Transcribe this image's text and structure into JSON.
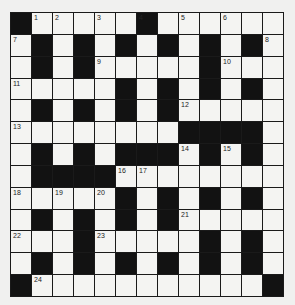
{
  "puzzle": {
    "rows": 13,
    "cols": 13,
    "colors": {
      "background": "#f0f0ef",
      "white_cell": "#f4f4f2",
      "black_cell": "#121212",
      "grid_line": "#1a1a1a"
    },
    "layout": [
      "#.....#......",
      ".#.#.#.#.#.#.",
      ".#.#.....#...",
      ".....#.#.#.#.",
      ".#.#.#.#.....",
      "........####.",
      ".#.#.###.#.#.",
      ".####........",
      ".....#.#.#.#.",
      ".#.#.#.#.....",
      "...#.....#.#.",
      ".#.#.#.#.#.#.",
      "#...........#"
    ],
    "numbers": [
      {
        "row": 0,
        "col": 1,
        "n": "1"
      },
      {
        "row": 0,
        "col": 2,
        "n": "2"
      },
      {
        "row": 0,
        "col": 4,
        "n": "3"
      },
      {
        "row": 0,
        "col": 6,
        "n": "4"
      },
      {
        "row": 0,
        "col": 8,
        "n": "5"
      },
      {
        "row": 0,
        "col": 10,
        "n": "6"
      },
      {
        "row": 1,
        "col": 0,
        "n": "7"
      },
      {
        "row": 1,
        "col": 12,
        "n": "8"
      },
      {
        "row": 2,
        "col": 4,
        "n": "9"
      },
      {
        "row": 2,
        "col": 10,
        "n": "10"
      },
      {
        "row": 3,
        "col": 0,
        "n": "11"
      },
      {
        "row": 4,
        "col": 8,
        "n": "12"
      },
      {
        "row": 5,
        "col": 0,
        "n": "13"
      },
      {
        "row": 6,
        "col": 8,
        "n": "14"
      },
      {
        "row": 6,
        "col": 10,
        "n": "15"
      },
      {
        "row": 7,
        "col": 5,
        "n": "16"
      },
      {
        "row": 7,
        "col": 6,
        "n": "17"
      },
      {
        "row": 8,
        "col": 0,
        "n": "18"
      },
      {
        "row": 8,
        "col": 2,
        "n": "19"
      },
      {
        "row": 8,
        "col": 4,
        "n": "20"
      },
      {
        "row": 9,
        "col": 8,
        "n": "21"
      },
      {
        "row": 10,
        "col": 0,
        "n": "22"
      },
      {
        "row": 10,
        "col": 4,
        "n": "23"
      },
      {
        "row": 12,
        "col": 1,
        "n": "24"
      }
    ]
  }
}
